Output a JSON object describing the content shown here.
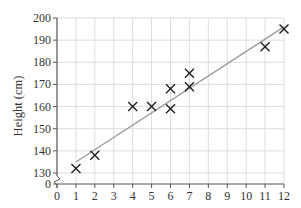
{
  "chart_data": {
    "type": "scatter",
    "title": "",
    "xlabel": "Shoe size",
    "ylabel": "Height (cm)",
    "xlim": [
      0,
      12
    ],
    "ylim": [
      130,
      200
    ],
    "y_axis_break": true,
    "y_break_bottom_label": "0",
    "grid": true,
    "x_ticks": [
      "0",
      "1",
      "2",
      "3",
      "4",
      "5",
      "6",
      "7",
      "8",
      "9",
      "10",
      "11",
      "12"
    ],
    "y_ticks": [
      "130",
      "140",
      "150",
      "160",
      "170",
      "180",
      "190",
      "200"
    ],
    "marker": "x",
    "points": [
      {
        "x": 1,
        "y": 132
      },
      {
        "x": 2,
        "y": 138
      },
      {
        "x": 4,
        "y": 160
      },
      {
        "x": 5,
        "y": 160
      },
      {
        "x": 6,
        "y": 159
      },
      {
        "x": 6,
        "y": 168
      },
      {
        "x": 7,
        "y": 169
      },
      {
        "x": 7,
        "y": 175
      },
      {
        "x": 11,
        "y": 187
      },
      {
        "x": 12,
        "y": 195
      }
    ],
    "line_of_best_fit": {
      "x1": 1,
      "y1": 135,
      "x2": 12,
      "y2": 196
    },
    "colors": {
      "axis": "#555555",
      "grid": "#dddddd",
      "marker": "#222222",
      "fit_line": "#999999"
    }
  }
}
